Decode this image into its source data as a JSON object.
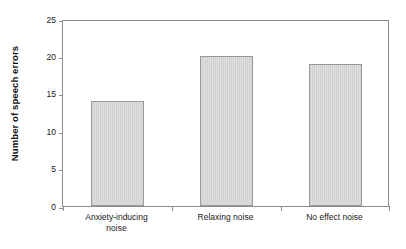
{
  "chart_data": {
    "type": "bar",
    "title": "",
    "subtitle": "",
    "xlabel": "",
    "ylabel": "Number of speech errors",
    "categories": [
      "Anxiety-inducing noise",
      "Relaxing noise",
      "No effect noise"
    ],
    "category_lines": [
      [
        "Anxiety-inducing",
        "noise"
      ],
      [
        "Relaxing noise",
        ""
      ],
      [
        "No effect noise",
        ""
      ]
    ],
    "values": [
      14,
      20,
      19
    ],
    "ylim": [
      0,
      25
    ],
    "yticks": [
      0,
      5,
      10,
      15,
      20,
      25
    ],
    "ytick_labels": [
      "0",
      "5",
      "10",
      "15",
      "20",
      "25"
    ],
    "grid": false,
    "legend": null,
    "legend_position": "none",
    "colors": {
      "bar_fill": "#d9d9d9",
      "bar_stripe": "#d2d2d2",
      "bar_border": "#9a9a9a",
      "axis": "#8c8c8c",
      "text": "#1a1a1a",
      "background": "#ffffff"
    }
  }
}
